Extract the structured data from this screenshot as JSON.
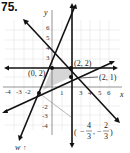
{
  "problem_number": "75.",
  "axes": {
    "x_label": "x",
    "y_label": "y",
    "w_label": "w",
    "x_ticks": [
      "-4",
      "-3",
      "-2",
      "1",
      "3",
      "4",
      "5",
      "6"
    ],
    "y_ticks": [
      "6",
      "5",
      "4",
      "3",
      "-2",
      "-3",
      "-4"
    ]
  },
  "points": [
    {
      "label": "(0, 2)"
    },
    {
      "label": "(2, 2)"
    },
    {
      "label": "(2, 1)"
    }
  ],
  "annotation": {
    "open_paren": "(",
    "minus1": "−",
    "num1": "4",
    "den1": "3",
    "comma": ",",
    "minus2": "−",
    "num2": "2",
    "den2": "3",
    "close_paren": ")"
  },
  "colors": {
    "line": "#111111",
    "grid": "#d8d8d8",
    "region": "#d9d9d9",
    "arrow_tip": "#9a9a9a"
  }
}
